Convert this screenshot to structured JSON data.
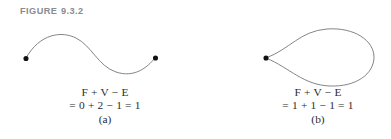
{
  "figure": {
    "header_prefix": "FIGURE",
    "header_number": "9.3.2"
  },
  "panels": [
    {
      "id": "a",
      "label": "(a)",
      "formula_line1": "F + V − E",
      "formula_line2": "= 0 + 2 − 1 = 1",
      "formula_terms": {
        "F": "F",
        "V": "V",
        "E": "E"
      },
      "values": {
        "F": 0,
        "V": 2,
        "E": 1,
        "result": 1
      },
      "shape": "open-sinusoidal-arc",
      "vertex_count": 2,
      "edge_count": 1,
      "face_count": 0
    },
    {
      "id": "b",
      "label": "(b)",
      "formula_line1": "F + V − E",
      "formula_line2": "= 1 + 1 − 1 = 1",
      "formula_terms": {
        "F": "F",
        "V": "V",
        "E": "E"
      },
      "values": {
        "F": 1,
        "V": 1,
        "E": 1,
        "result": 1
      },
      "shape": "closed-teardrop-loop",
      "vertex_count": 1,
      "edge_count": 1,
      "face_count": 1
    }
  ],
  "style": {
    "header_color": "#8b8b8f",
    "curve_color": "#6f6f73",
    "vertex_color": "#111111",
    "text_color": "#2d2d2d",
    "background": "#ffffff"
  }
}
